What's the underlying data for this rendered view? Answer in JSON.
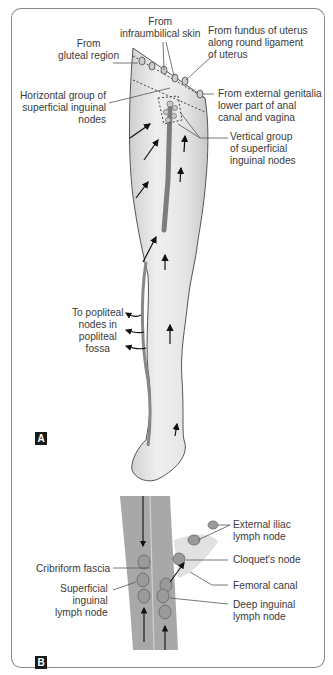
{
  "figure": {
    "panel_a": {
      "badge": "A",
      "labels": {
        "infraumbilical": "From\ninfraumbilical skin",
        "gluteal": "From\ngluteal region",
        "uterus": "From fundus of uterus\nalong round ligament\nof uterus",
        "horizontal_group": "Horizontal group of\nsuperficial inguinal\nnodes",
        "external_genitalia": "From external genitalia\nlower part of anal\ncanal and vagina",
        "vertical_group": "Vertical group\nof superficial\ninguinal nodes",
        "popliteal": "To popliteal\nnodes in\npopliteal\nfossa"
      }
    },
    "panel_b": {
      "badge": "B",
      "labels": {
        "external_iliac": "External iliac\nlymph node",
        "cloquet": "Cloquet's node",
        "cribriform": "Cribriform fascia",
        "femoral_canal": "Femoral canal",
        "superficial_inguinal": "Superficial\ninguinal\nlymph node",
        "deep_inguinal": "Deep inguinal\nlymph node"
      }
    },
    "colors": {
      "frame": "#8a8a8a",
      "leg_fill": "#e8e8e8",
      "leg_outline": "#555555",
      "vein": "#8c8c8c",
      "node_fill": "#9a9a9a",
      "fascia_band": "#a8a8a8",
      "badge_bg": "#1a1a1a"
    }
  }
}
